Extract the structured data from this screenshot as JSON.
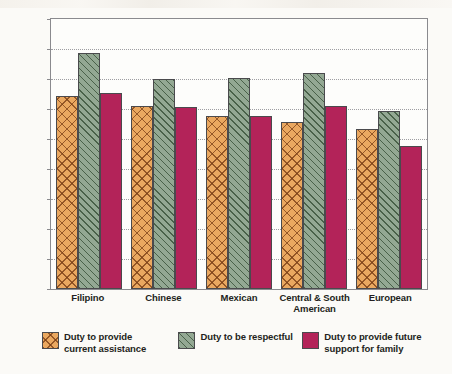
{
  "chart_data": {
    "type": "bar",
    "title": "",
    "xlabel": "",
    "ylabel": "Strength of Value",
    "ylim": [
      0,
      4.5
    ],
    "ytick_labels": [
      "0",
      "0.5",
      "1",
      "1.5",
      "2",
      "2.5",
      "3",
      "3.5",
      "4",
      "4.5"
    ],
    "ytick_values": [
      0,
      0.5,
      1,
      1.5,
      2,
      2.5,
      3,
      3.5,
      4,
      4.5
    ],
    "grid": "horizontal-dotted",
    "legend_position": "bottom",
    "categories": [
      "Filipino",
      "Chinese",
      "Mexican",
      "Central & South American",
      "European"
    ],
    "category_lines": [
      [
        "Filipino"
      ],
      [
        "Chinese"
      ],
      [
        "Mexican"
      ],
      [
        "Central & South",
        "American"
      ],
      [
        "European"
      ]
    ],
    "series": [
      {
        "name": "Duty to provide current assistance",
        "name_lines": [
          "Duty to provide",
          "current assistance"
        ],
        "color": "#eaa860",
        "pattern": "crosshatch",
        "values": [
          3.22,
          3.05,
          2.88,
          2.79,
          2.67
        ]
      },
      {
        "name": "Duty to be respectful",
        "name_lines": [
          "Duty to be respectful"
        ],
        "color": "#93a893",
        "pattern": "diagonal-hatch",
        "values": [
          3.93,
          3.5,
          3.52,
          3.6,
          2.97
        ]
      },
      {
        "name": "Duty to provide future support for family",
        "name_lines": [
          "Duty to provide future",
          "support for family"
        ],
        "color": "#b32359",
        "pattern": "solid",
        "values": [
          3.27,
          3.04,
          2.89,
          3.05,
          2.38
        ]
      }
    ]
  }
}
